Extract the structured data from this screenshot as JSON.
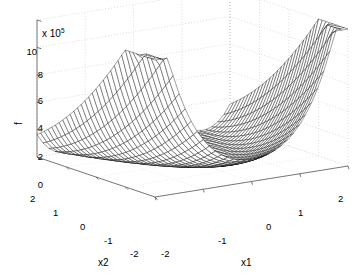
{
  "figure": {
    "type": "matlab-mesh-surface-plot",
    "background_color": "#ffffff",
    "mesh_color": "#000000",
    "grid_color": "#cccccc",
    "axis_color": "#555555"
  },
  "axes": {
    "z": {
      "label": "f",
      "exponent_text": "x 10",
      "exponent_value": "5",
      "ticks": [
        "0",
        "2",
        "4",
        "6",
        "8",
        "10"
      ],
      "range": [
        0,
        10
      ]
    },
    "x1": {
      "label": "x1",
      "ticks": [
        "-2",
        "-1",
        "0",
        "1",
        "2"
      ],
      "range": [
        -2,
        2
      ]
    },
    "x2": {
      "label": "x2",
      "ticks": [
        "2",
        "1",
        "0",
        "-1",
        "-2"
      ],
      "range": [
        -2,
        2
      ]
    }
  },
  "chart_data": {
    "type": "surface",
    "title": "",
    "xlabel": "x1",
    "ylabel": "x2",
    "zlabel": "f",
    "z_scale_exponent": 5,
    "xlim": [
      -2,
      2
    ],
    "ylim": [
      -2,
      2
    ],
    "zlim": [
      0,
      10
    ],
    "grid": true,
    "legend": "none",
    "x1_ticks": [
      -2,
      -1,
      0,
      1,
      2
    ],
    "x2_ticks": [
      -2,
      -1,
      0,
      1,
      2
    ],
    "z_ticks": [
      0,
      2,
      4,
      6,
      8,
      10
    ],
    "mesh_resolution": 33,
    "surface_description": "Rosenbrock-like banana valley: tall peak ~10e5 at (x1=-2, x2=2), broad flat near-zero curved valley through the middle, secondary rise ~2e5 at (x1=2, x2=-2).",
    "z_values_corners": {
      "x1=-2,x2=2": 10.0,
      "x1=-2,x2=-2": 0.4,
      "x1=2,x2=2": 0.4,
      "x1=2,x2=-2": 2.1
    },
    "sampled_surface": {
      "x1": [
        -2,
        -1,
        0,
        1,
        2
      ],
      "x2": [
        2,
        1,
        0,
        -1,
        -2
      ],
      "z": [
        [
          10.0,
          3.7,
          0.9,
          0.6,
          0.4
        ],
        [
          5.2,
          1.2,
          0.2,
          0.3,
          1.1
        ],
        [
          2.2,
          0.3,
          0.0,
          0.4,
          1.6
        ],
        [
          0.9,
          0.1,
          0.2,
          0.7,
          1.9
        ],
        [
          0.4,
          0.3,
          0.6,
          1.2,
          2.1
        ]
      ]
    }
  },
  "ticklabels": {
    "z": [
      {
        "text": "10",
        "x": 27,
        "y": 52
      },
      {
        "text": "8",
        "x": 33,
        "y": 75
      },
      {
        "text": "6",
        "x": 33,
        "y": 101
      },
      {
        "text": "4",
        "x": 33,
        "y": 128
      },
      {
        "text": "2",
        "x": 33,
        "y": 157
      },
      {
        "text": "0",
        "x": 33,
        "y": 185
      }
    ],
    "x2": [
      {
        "text": "2",
        "x": 30,
        "y": 194
      },
      {
        "text": "1",
        "x": 53,
        "y": 208
      },
      {
        "text": "0",
        "x": 80,
        "y": 222
      },
      {
        "text": "-1",
        "x": 104,
        "y": 236
      },
      {
        "text": "-2",
        "x": 130,
        "y": 249
      }
    ],
    "x1": [
      {
        "text": "-2",
        "x": 161,
        "y": 249
      },
      {
        "text": "-1",
        "x": 218,
        "y": 236
      },
      {
        "text": "0",
        "x": 266,
        "y": 222
      },
      {
        "text": "1",
        "x": 298,
        "y": 208
      },
      {
        "text": "2",
        "x": 338,
        "y": 194
      }
    ]
  },
  "axis_titles": {
    "x1": {
      "text": "x1",
      "x": 241,
      "y": 258
    },
    "x2": {
      "text": "x2",
      "x": 98,
      "y": 258
    },
    "f": {
      "text": "f",
      "x": 17,
      "y": 118
    }
  },
  "exponent_label": {
    "text": "x 10",
    "sup": "5",
    "x": 42,
    "y": 26
  }
}
